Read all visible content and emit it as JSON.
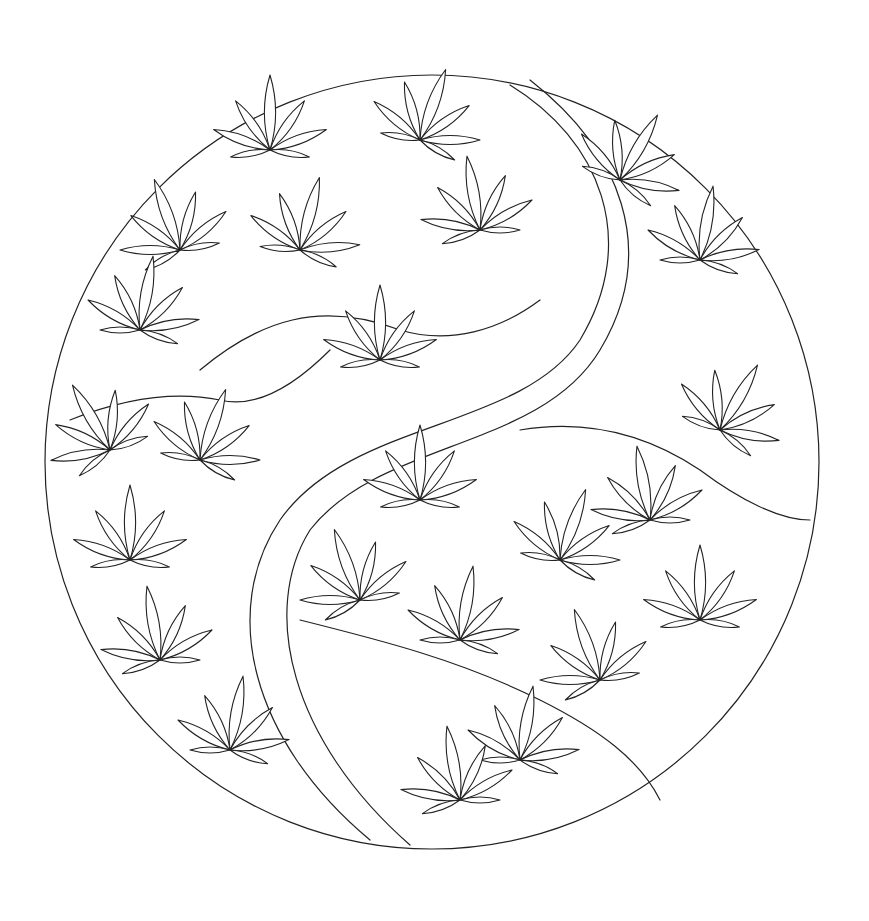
{
  "artwork": {
    "subject": "yin-yang symbol filled with leaves",
    "style": "black line art coloring page",
    "colors": {
      "line": "#222222",
      "background": "#ffffff"
    }
  }
}
